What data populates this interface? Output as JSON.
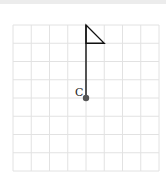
{
  "diagram": {
    "grid": {
      "columns": 8,
      "rows": 8,
      "line_color": "#e2e2e2",
      "left": 13,
      "top": 25,
      "cell": 18.25
    },
    "flag": {
      "pole_color": "#111111",
      "point_label": "C",
      "point_color": "#555555",
      "pole_base": [
        4,
        4
      ],
      "pole_top": [
        4,
        0
      ],
      "flag_tip": [
        5,
        1
      ],
      "flag_bottom": [
        4,
        1
      ]
    }
  }
}
